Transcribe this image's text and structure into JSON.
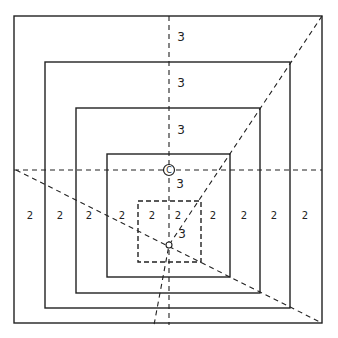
{
  "diagram": {
    "center_label": "C",
    "stroke_color": "#222222",
    "background": "#ffffff",
    "boxes": [
      {
        "x": 14,
        "y": 16,
        "w": 308,
        "h": 307,
        "style": "solid"
      },
      {
        "x": 45,
        "y": 62,
        "w": 245,
        "h": 246,
        "style": "solid"
      },
      {
        "x": 76,
        "y": 108,
        "w": 184,
        "h": 185,
        "style": "solid"
      },
      {
        "x": 107,
        "y": 154,
        "w": 123,
        "h": 123,
        "style": "solid"
      },
      {
        "x": 138,
        "y": 201,
        "w": 63,
        "h": 61,
        "style": "dashed"
      }
    ],
    "labels_row": {
      "y": 219,
      "text": "2",
      "x_positions": [
        30,
        60,
        89,
        122,
        152,
        178,
        213,
        244,
        274,
        305
      ]
    },
    "labels_column": {
      "x": 181,
      "text": "3",
      "y_positions": [
        41,
        87,
        134,
        188,
        238
      ]
    },
    "labels_2": [
      "2",
      "2",
      "2",
      "2",
      "2",
      "2",
      "2",
      "2",
      "2",
      "2"
    ],
    "labels_3": [
      "3",
      "3",
      "3",
      "3",
      "3"
    ]
  }
}
